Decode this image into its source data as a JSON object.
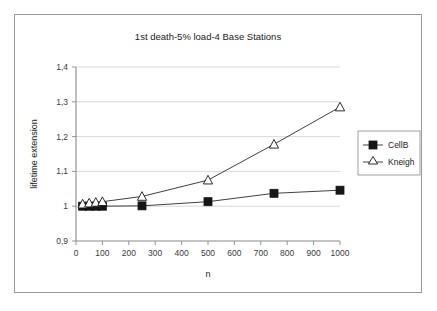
{
  "chart_data": {
    "type": "line",
    "title": "1st death-5% load-4 Base Stations",
    "xlabel": "n",
    "ylabel": "lifetime extension",
    "xlim": [
      0,
      1000
    ],
    "ylim": [
      0.9,
      1.4
    ],
    "grid": true,
    "legend_position": "right",
    "x_ticks": [
      "0",
      "100",
      "200",
      "300",
      "400",
      "500",
      "600",
      "700",
      "800",
      "900",
      "1000"
    ],
    "x_tick_values": [
      0,
      100,
      200,
      300,
      400,
      500,
      600,
      700,
      800,
      900,
      1000
    ],
    "y_ticks": [
      "0,9",
      "1",
      "1,1",
      "1,2",
      "1,3",
      "1,4"
    ],
    "y_tick_values": [
      0.9,
      1.0,
      1.1,
      1.2,
      1.3,
      1.4
    ],
    "series": [
      {
        "name": "CellB",
        "marker": "filled-square",
        "x": [
          25,
          50,
          75,
          100,
          250,
          500,
          750,
          1000
        ],
        "values": [
          1.0,
          1.0,
          1.0,
          1.0,
          1.001,
          1.013,
          1.037,
          1.046
        ]
      },
      {
        "name": "Kneigh",
        "marker": "hollow-triangle",
        "x": [
          25,
          50,
          75,
          100,
          250,
          500,
          750,
          1000
        ],
        "values": [
          1.006,
          1.009,
          1.011,
          1.013,
          1.028,
          1.075,
          1.178,
          1.285
        ]
      }
    ]
  },
  "legend": {
    "entries": [
      {
        "label": "CellB"
      },
      {
        "label": "Kneigh"
      }
    ]
  },
  "colors": {
    "line": "#2b2b2b",
    "marker_fill": "#161616",
    "grid": "#c8c8c8",
    "axis": "#8a8a8a",
    "frame": "#9a9a9a",
    "background": "#ffffff"
  }
}
